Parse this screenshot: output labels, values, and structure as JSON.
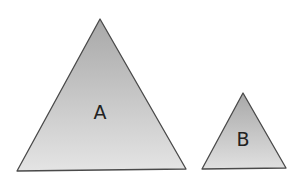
{
  "diagram": {
    "triangles": [
      {
        "label": "A",
        "points": "100,19 17,171 186,169",
        "label_x": 100,
        "label_y": 119
      },
      {
        "label": "B",
        "points": "243,93 202,169 286,168",
        "label_x": 243,
        "label_y": 146
      }
    ],
    "colors": {
      "fill_top": "#a6a6a6",
      "fill_bottom": "#e6e6e6",
      "stroke": "#4a4a4a"
    }
  }
}
